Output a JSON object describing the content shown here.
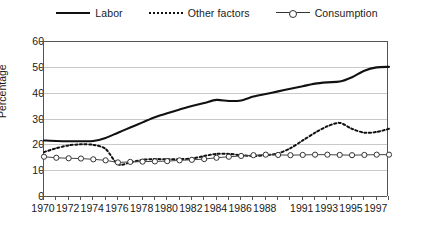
{
  "legend": {
    "items": [
      {
        "label": "Labor",
        "style": "solid",
        "color": "#111111"
      },
      {
        "label": "Other factors",
        "style": "dotted",
        "color": "#111111"
      },
      {
        "label": "Consumption",
        "style": "line-marker",
        "color": "#333333"
      }
    ]
  },
  "chart_data": {
    "type": "line",
    "title": "",
    "xlabel": "",
    "ylabel": "Percentage",
    "ylim": [
      0,
      60
    ],
    "yticks": [
      0,
      10,
      20,
      30,
      40,
      50,
      60
    ],
    "xlim": [
      1970,
      1998
    ],
    "x": [
      1970,
      1971,
      1972,
      1973,
      1974,
      1975,
      1976,
      1977,
      1978,
      1979,
      1980,
      1981,
      1982,
      1983,
      1984,
      1985,
      1986,
      1987,
      1988,
      1989,
      1990,
      1991,
      1992,
      1993,
      1994,
      1995,
      1996,
      1997,
      1998
    ],
    "xtick_labels": [
      "1970",
      "",
      "1972",
      "",
      "1974",
      "",
      "1976",
      "",
      "1978",
      "",
      "1980",
      "",
      "1982",
      "",
      "1984",
      "",
      "1986",
      "",
      "1988",
      "",
      "",
      "1991",
      "",
      "1993",
      "",
      "1995",
      "",
      "1997",
      ""
    ],
    "grid": "horizontal",
    "legend_position": "top",
    "series": [
      {
        "name": "Labor",
        "style": "solid",
        "color": "#111111",
        "values": [
          21.5,
          21.3,
          21.2,
          21.2,
          21.3,
          22.5,
          24.5,
          26.5,
          28.5,
          30.5,
          32.0,
          33.5,
          34.8,
          36.0,
          37.2,
          36.8,
          37.0,
          38.5,
          39.5,
          40.5,
          41.5,
          42.5,
          43.5,
          44.0,
          44.3,
          46.0,
          48.5,
          49.8,
          50.0
        ]
      },
      {
        "name": "Other factors",
        "style": "dotted",
        "color": "#111111",
        "values": [
          17.0,
          18.5,
          19.6,
          20.0,
          19.8,
          18.2,
          12.3,
          13.0,
          14.0,
          14.3,
          14.2,
          14.3,
          14.5,
          15.5,
          16.3,
          16.3,
          15.8,
          15.5,
          15.8,
          16.5,
          18.5,
          21.5,
          24.5,
          27.0,
          28.3,
          26.0,
          24.5,
          24.8,
          26.0
        ]
      },
      {
        "name": "Consumption",
        "style": "line-marker",
        "color": "#333333",
        "values": [
          15.2,
          14.8,
          14.6,
          14.5,
          14.2,
          13.8,
          13.0,
          13.2,
          13.3,
          13.4,
          13.5,
          13.8,
          14.0,
          14.3,
          14.8,
          15.2,
          15.5,
          15.8,
          16.0,
          15.9,
          15.8,
          15.9,
          16.0,
          16.0,
          15.9,
          15.8,
          15.9,
          16.0,
          16.0
        ]
      }
    ]
  }
}
